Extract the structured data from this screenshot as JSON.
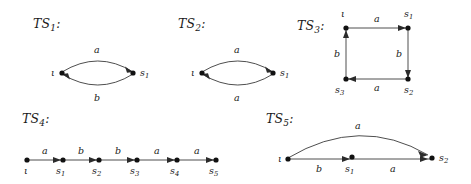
{
  "figure": {
    "background_color": "#ffffff",
    "ink_color": "#1a1a1a",
    "edge_color": "#3a3a3a",
    "node_color": "#111111",
    "width": 471,
    "height": 184
  },
  "systems": [
    {
      "id": "ts1",
      "title": "TS",
      "title_sub": "1",
      "title_colon": ":",
      "nodes": [
        {
          "name": "iota",
          "label": "ι"
        },
        {
          "name": "s1",
          "label": "s",
          "sub": "1"
        }
      ],
      "edges": [
        {
          "from": "iota",
          "to": "s1",
          "label": "a",
          "shape": "arc-up"
        },
        {
          "from": "s1",
          "to": "iota",
          "label": "b",
          "shape": "arc-down"
        }
      ]
    },
    {
      "id": "ts2",
      "title": "TS",
      "title_sub": "2",
      "title_colon": ":",
      "nodes": [
        {
          "name": "iota",
          "label": "ι"
        },
        {
          "name": "s1",
          "label": "s",
          "sub": "1"
        }
      ],
      "edges": [
        {
          "from": "iota",
          "to": "s1",
          "label": "a",
          "shape": "arc-up"
        },
        {
          "from": "s1",
          "to": "iota",
          "label": "a",
          "shape": "arc-down"
        }
      ]
    },
    {
      "id": "ts3",
      "title": "TS",
      "title_sub": "3",
      "title_colon": ":",
      "nodes": [
        {
          "name": "iota",
          "label": "ι"
        },
        {
          "name": "s1",
          "label": "s",
          "sub": "1"
        },
        {
          "name": "s2",
          "label": "s",
          "sub": "2"
        },
        {
          "name": "s3",
          "label": "s",
          "sub": "3"
        }
      ],
      "edges": [
        {
          "from": "iota",
          "to": "s1",
          "label": "a",
          "shape": "straight-right"
        },
        {
          "from": "s1",
          "to": "s2",
          "label": "b",
          "shape": "straight-down"
        },
        {
          "from": "s2",
          "to": "s3",
          "label": "a",
          "shape": "straight-left"
        },
        {
          "from": "s3",
          "to": "iota",
          "label": "b",
          "shape": "straight-up"
        }
      ]
    },
    {
      "id": "ts4",
      "title": "TS",
      "title_sub": "4",
      "title_colon": ":",
      "nodes": [
        {
          "name": "iota",
          "label": "ι"
        },
        {
          "name": "s1",
          "label": "s",
          "sub": "1"
        },
        {
          "name": "s2",
          "label": "s",
          "sub": "2"
        },
        {
          "name": "s3",
          "label": "s",
          "sub": "3"
        },
        {
          "name": "s4",
          "label": "s",
          "sub": "4"
        },
        {
          "name": "s5",
          "label": "s",
          "sub": "5"
        }
      ],
      "edges": [
        {
          "from": "iota",
          "to": "s1",
          "label": "a",
          "shape": "straight-right"
        },
        {
          "from": "s1",
          "to": "s2",
          "label": "b",
          "shape": "straight-right"
        },
        {
          "from": "s2",
          "to": "s3",
          "label": "b",
          "shape": "straight-right"
        },
        {
          "from": "s3",
          "to": "s4",
          "label": "a",
          "shape": "straight-right"
        },
        {
          "from": "s4",
          "to": "s5",
          "label": "a",
          "shape": "straight-right"
        }
      ]
    },
    {
      "id": "ts5",
      "title": "TS",
      "title_sub": "5",
      "title_colon": ":",
      "nodes": [
        {
          "name": "iota",
          "label": "ι"
        },
        {
          "name": "s1",
          "label": "s",
          "sub": "1"
        },
        {
          "name": "s2",
          "label": "s",
          "sub": "2"
        }
      ],
      "edges": [
        {
          "from": "iota",
          "to": "s2",
          "label": "a",
          "shape": "arc-up"
        },
        {
          "from": "iota",
          "to": "s1",
          "label": "b",
          "shape": "straight-right"
        },
        {
          "from": "s1",
          "to": "s2",
          "label": "a",
          "shape": "straight-right"
        }
      ]
    }
  ]
}
